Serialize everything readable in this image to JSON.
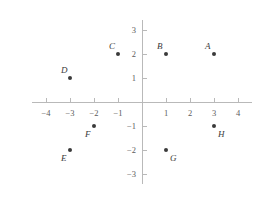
{
  "chart_data": {
    "type": "scatter",
    "title": "",
    "subtitle": "",
    "xlabel": "",
    "ylabel": "",
    "xlim": [
      -4.6,
      4.6
    ],
    "ylim": [
      -3.4,
      3.4
    ],
    "grid": false,
    "legend": false,
    "x_ticks": [
      -4,
      -3,
      -2,
      -1,
      1,
      2,
      3,
      4
    ],
    "y_ticks": [
      3,
      2,
      1,
      -1,
      -2,
      -3
    ],
    "x_tick_labels": [
      "−4",
      "−3",
      "−2",
      "−1",
      "1",
      "2",
      "3",
      "4"
    ],
    "y_tick_labels": [
      "3",
      "2",
      "1",
      "−1",
      "−2",
      "−3"
    ],
    "points": [
      {
        "label": "A",
        "x": 3,
        "y": 2,
        "label_pos": "top-left"
      },
      {
        "label": "B",
        "x": 1,
        "y": 2,
        "label_pos": "top-left"
      },
      {
        "label": "C",
        "x": -1,
        "y": 2,
        "label_pos": "top-left"
      },
      {
        "label": "D",
        "x": -3,
        "y": 1,
        "label_pos": "top-left"
      },
      {
        "label": "E",
        "x": -3,
        "y": -2,
        "label_pos": "bottom-left"
      },
      {
        "label": "F",
        "x": -2,
        "y": -1,
        "label_pos": "bottom-left"
      },
      {
        "label": "G",
        "x": 1,
        "y": -2,
        "label_pos": "bottom-right"
      },
      {
        "label": "H",
        "x": 3,
        "y": -1,
        "label_pos": "bottom-right"
      }
    ],
    "colors": {
      "point": "#3a3a3a",
      "axis": "#b9b9b9",
      "tick_label": "#5c5c5c",
      "background": "#ffffff"
    }
  }
}
